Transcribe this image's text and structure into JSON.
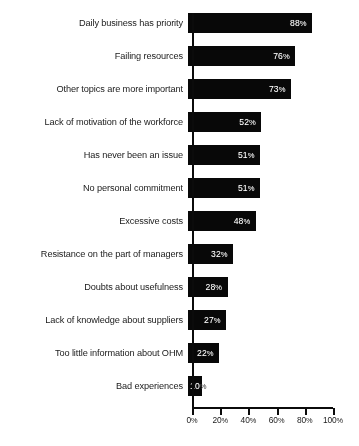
{
  "chart_data": {
    "type": "bar",
    "orientation": "horizontal",
    "title": "",
    "subtitle": "",
    "xlabel": "",
    "ylabel": "",
    "xlim": [
      0,
      100
    ],
    "grid": false,
    "legend": null,
    "bar_color": "#0d0d0d",
    "value_label_color": "#ffffff",
    "background_color": "#ffffff",
    "axis_color": "#101010",
    "categories": [
      "Daily business has priority",
      "Failing resources",
      "Other topics are more important",
      "Lack of motivation of the workforce",
      "Has never been an issue",
      "No personal commitment",
      "Excessive costs",
      "Resistance on the part of managers",
      "Doubts about usefulness",
      "Lack of knowledge about suppliers",
      "Too little information about OHM",
      "Bad experiences"
    ],
    "values": [
      88,
      76,
      73,
      52,
      51,
      51,
      48,
      32,
      28,
      27,
      22,
      10
    ],
    "value_labels": [
      "88",
      "76",
      "73",
      "52",
      "51",
      "51",
      "48",
      "32",
      "28",
      "27",
      "22",
      "10"
    ],
    "value_suffix": "%",
    "xticks": [
      0,
      20,
      40,
      60,
      80,
      100
    ],
    "xtick_labels": [
      "0",
      "20",
      "40",
      "60",
      "80",
      "100"
    ],
    "xtick_suffix": "%"
  },
  "caption": {
    "text": ""
  }
}
